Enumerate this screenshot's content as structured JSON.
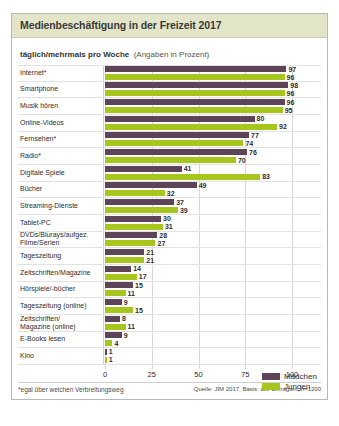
{
  "chart_data": {
    "type": "bar",
    "orientation": "horizontal",
    "title": "Medienbeschäftigung in der Freizeit 2017",
    "subtitle_strong": "täglich/mehrmals pro Woche",
    "subtitle_note": "(Angaben in Prozent)",
    "xlabel": "",
    "ylabel": "",
    "xlim": [
      0,
      100
    ],
    "xticks": [
      "0",
      "25",
      "50",
      "75",
      "100"
    ],
    "grid": true,
    "legend_position": "middle-right",
    "categories": [
      "Internet*",
      "Smartphone",
      "Musik hören",
      "Online-Videos",
      "Fernsehen*",
      "Radio*",
      "Digitale Spiele",
      "Bücher",
      "Streaming-Dienste",
      "Tablet-PC",
      "DVDs/Blurays/aufgez.\nFilme/Serien",
      "Tageszeitung",
      "Zeitschriften/Magazine",
      "Hörspiele/-bücher",
      "Tageszeitung (online)",
      "Zeitschriften/\nMagazine (online)",
      "E-Books lesen",
      "Kino"
    ],
    "series": [
      {
        "name": "Mädchen",
        "color": "#5d4458",
        "values": [
          97,
          98,
          96,
          80,
          77,
          76,
          41,
          49,
          37,
          30,
          28,
          21,
          14,
          15,
          9,
          8,
          9,
          1
        ]
      },
      {
        "name": "Jungen",
        "color": "#a6c61e",
        "values": [
          96,
          96,
          95,
          92,
          74,
          70,
          83,
          32,
          39,
          31,
          27,
          21,
          17,
          11,
          15,
          11,
          4,
          1
        ]
      }
    ],
    "footnote": "*egal über welchen Verbreitungsweg",
    "source": "Quelle: JIM 2017, Basis: alle Befragten, n=1200"
  },
  "colors": {
    "maedchen": "#5d4458",
    "jungen": "#a6c61e",
    "header_bg": "#e3e5c8",
    "frame_border": "#b9b9b9"
  }
}
